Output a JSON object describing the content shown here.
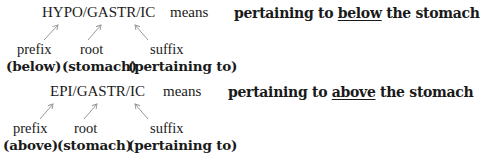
{
  "examples": [
    {
      "term": "HYPO/GASTR/IC",
      "means_label": "means",
      "definition": {
        "before": "pertaining to ",
        "emphasis": "below",
        "after": " the stomach"
      },
      "parts": [
        {
          "type": "prefix",
          "gloss": "(below)"
        },
        {
          "type": "root",
          "gloss": "(stomach)"
        },
        {
          "type": "suffix",
          "gloss": "(pertaining to)"
        }
      ]
    },
    {
      "term": "EPI/GASTR/IC",
      "means_label": "means",
      "definition": {
        "before": "pertaining to ",
        "emphasis": "above",
        "after": " the stomach"
      },
      "parts": [
        {
          "type": "prefix",
          "gloss": "(above)"
        },
        {
          "type": "root",
          "gloss": "(stomach)"
        },
        {
          "type": "suffix",
          "gloss": "(pertaining to)"
        }
      ]
    }
  ],
  "colors": {
    "text": "#1a1a1a",
    "arrow": "#9a9a9a"
  }
}
